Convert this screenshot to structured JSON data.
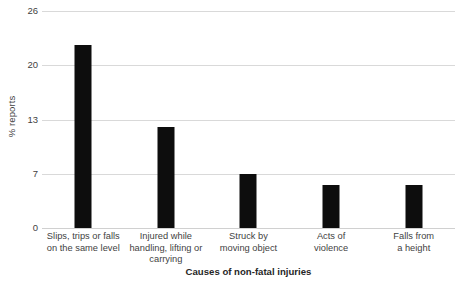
{
  "chart_data": {
    "type": "bar",
    "title": "",
    "xlabel": "Causes of non-fatal injuries",
    "ylabel": "% reports",
    "categories": [
      "Slips, trips or falls on the same level",
      "Injured while handling, lifting or carrying",
      "Struck by moving object",
      "Acts of violence",
      "Falls from a height"
    ],
    "category_lines": [
      [
        "Slips, trips or falls",
        "on the same level"
      ],
      [
        "Injured while",
        "handling, lifting or",
        "carrying"
      ],
      [
        "Struck by",
        "moving object"
      ],
      [
        "Acts of",
        "violence"
      ],
      [
        "Falls from",
        "a height"
      ]
    ],
    "values": [
      22.2,
      12.2,
      7.0,
      5.6,
      5.6
    ],
    "ytick_labels": [
      "26",
      "20",
      "13",
      "7",
      "0"
    ],
    "ytick_values": [
      26,
      20,
      13,
      7,
      0
    ],
    "ylim": [
      0,
      26
    ],
    "grid": true,
    "legend": false,
    "bar_color": "#0d0d0d",
    "grid_color": "#d9d9d9",
    "background_color": "#ffffff",
    "text_color": "#3f3f3f"
  }
}
